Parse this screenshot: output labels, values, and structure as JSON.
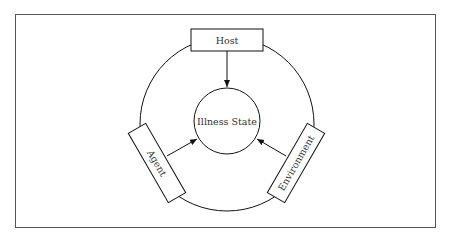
{
  "diagram": {
    "type": "epidemiological-triad",
    "center": {
      "label": "Illness State"
    },
    "nodes": [
      {
        "id": "host",
        "label": "Host",
        "position": "top"
      },
      {
        "id": "agent",
        "label": "Agent",
        "position": "bottom-left"
      },
      {
        "id": "environment",
        "label": "Environment",
        "position": "bottom-right"
      }
    ],
    "edges": [
      {
        "from": "host",
        "to": "center"
      },
      {
        "from": "agent",
        "to": "center"
      },
      {
        "from": "environment",
        "to": "center"
      }
    ]
  }
}
